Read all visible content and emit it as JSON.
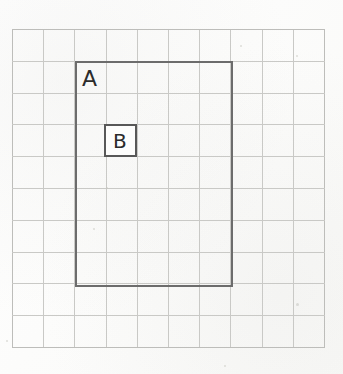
{
  "figure": {
    "kind": "graph-paper-diagram",
    "background_color": "#fdfdfc",
    "grid": {
      "columns": 10,
      "rows": 10,
      "x": 12,
      "y": 29,
      "width": 313,
      "height": 319,
      "cell_width": 31.3,
      "cell_height": 31.9,
      "line_color": "#c9c9c6",
      "edge_color": "#bdbdba",
      "line_width": 1
    },
    "shapes": [
      {
        "id": "rect-a",
        "name": "rectangle-a",
        "label": "A",
        "x": 75,
        "y": 61,
        "width": 158,
        "height": 226,
        "cells_wide": 5,
        "cells_tall": 7,
        "stroke_color": "#6c6c6c",
        "stroke_width": 2,
        "fill": "none",
        "label_x": 82,
        "label_y": 68
      },
      {
        "id": "square-b",
        "name": "square-b",
        "label": "B",
        "x": 104,
        "y": 124,
        "width": 33,
        "height": 33,
        "cells_wide": 1,
        "cells_tall": 1,
        "stroke_color": "#585858",
        "stroke_width": 2,
        "fill": "#fdfdfc",
        "label_x": 113,
        "label_y": 131
      }
    ]
  }
}
